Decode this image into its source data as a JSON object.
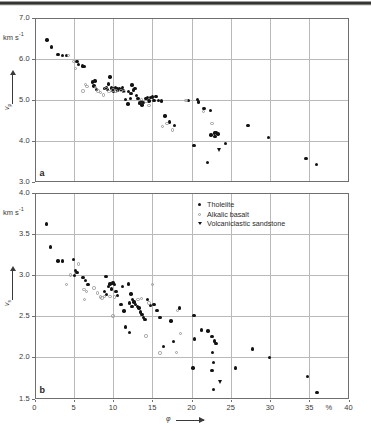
{
  "figure": {
    "panel_a_label": "a",
    "panel_b_label": "b",
    "xaxis_symbol": "φ",
    "percent_symbol": "%",
    "unit_label": "km s",
    "unit_exponent": "-1",
    "vp_symbol": "v",
    "vp_sub": "p",
    "vs_symbol": "v",
    "vs_sub": "s"
  },
  "legend": {
    "items": [
      {
        "label": "Tholeiite",
        "marker": "filled-circle",
        "color": "#121212"
      },
      {
        "label": "Alkalic basalt",
        "marker": "open-circle",
        "color": "#9a9a98"
      },
      {
        "label": "Volcaniclastic sandstone",
        "marker": "filled-triangle-down",
        "color": "#121212"
      }
    ]
  },
  "chart_data": [
    {
      "type": "scatter",
      "panel": "a",
      "title": "",
      "xlabel": "φ",
      "ylabel": "v_p",
      "yunit": "km s^-1",
      "xunit": "%",
      "xlim": [
        0,
        40
      ],
      "ylim": [
        3.0,
        7.0
      ],
      "xticks": [
        0,
        5,
        10,
        15,
        20,
        25,
        30,
        35,
        40
      ],
      "yticks": [
        3.0,
        4.0,
        5.0,
        6.0,
        7.0
      ],
      "ytick_labels": [
        "3.0",
        "4.0",
        "5.0",
        "6.0",
        "7.0"
      ],
      "xtick_labels": [
        "0",
        "5",
        "10",
        "15",
        "20",
        "25",
        "30",
        "35",
        "40"
      ],
      "grid": true,
      "legend_position": "none",
      "series": [
        {
          "name": "Tholeiite",
          "marker": "filled-circle",
          "points": [
            [
              1.6,
              6.45
            ],
            [
              2.2,
              6.28
            ],
            [
              3.0,
              6.1
            ],
            [
              3.6,
              6.07
            ],
            [
              4.1,
              6.08
            ],
            [
              5.4,
              5.92
            ],
            [
              5.6,
              5.86
            ],
            [
              6.1,
              5.82
            ],
            [
              6.3,
              5.8
            ],
            [
              7.4,
              5.43
            ],
            [
              7.7,
              5.45
            ],
            [
              7.6,
              5.33
            ],
            [
              7.9,
              5.25
            ],
            [
              9.2,
              5.3
            ],
            [
              9.4,
              5.38
            ],
            [
              9.6,
              5.55
            ],
            [
              9.8,
              5.28
            ],
            [
              9.9,
              5.22
            ],
            [
              10.1,
              5.27
            ],
            [
              10.3,
              5.29
            ],
            [
              10.5,
              5.26
            ],
            [
              10.1,
              5.21
            ],
            [
              10.6,
              5.22
            ],
            [
              10.8,
              5.27
            ],
            [
              11.0,
              5.25
            ],
            [
              11.2,
              5.3
            ],
            [
              11.3,
              5.21
            ],
            [
              9.0,
              5.27
            ],
            [
              9.3,
              5.24
            ],
            [
              11.6,
              5.0
            ],
            [
              11.9,
              4.89
            ],
            [
              12.2,
              5.02
            ],
            [
              12.4,
              5.35
            ],
            [
              12.6,
              5.23
            ],
            [
              12.8,
              5.27
            ],
            [
              13.0,
              5.1
            ],
            [
              13.2,
              5.02
            ],
            [
              12.0,
              5.2
            ],
            [
              12.3,
              5.15
            ],
            [
              13.6,
              4.95
            ],
            [
              13.9,
              4.93
            ],
            [
              14.2,
              5.02
            ],
            [
              14.4,
              5.05
            ],
            [
              14.6,
              4.96
            ],
            [
              14.8,
              5.05
            ],
            [
              15.0,
              5.06
            ],
            [
              15.2,
              4.97
            ],
            [
              15.5,
              5.07
            ],
            [
              15.8,
              4.97
            ],
            [
              16.2,
              4.96
            ],
            [
              13.4,
              4.91
            ],
            [
              13.7,
              4.87
            ],
            [
              16.6,
              4.6
            ],
            [
              17.2,
              4.45
            ],
            [
              17.8,
              4.36
            ],
            [
              19.6,
              4.97
            ],
            [
              20.8,
              5.0
            ],
            [
              20.9,
              4.94
            ],
            [
              21.6,
              4.78
            ],
            [
              22.4,
              4.73
            ],
            [
              22.5,
              4.13
            ],
            [
              22.9,
              4.18
            ],
            [
              23.1,
              4.19
            ],
            [
              23.4,
              4.16
            ],
            [
              23.0,
              4.1
            ],
            [
              20.3,
              3.88
            ],
            [
              22.0,
              3.46
            ],
            [
              24.3,
              3.92
            ],
            [
              27.2,
              4.36
            ],
            [
              29.8,
              4.07
            ],
            [
              34.6,
              3.56
            ],
            [
              35.9,
              3.41
            ]
          ]
        },
        {
          "name": "Alkalic basalt",
          "marker": "open-circle",
          "points": [
            [
              4.3,
              6.08
            ],
            [
              5.0,
              5.92
            ],
            [
              5.2,
              5.76
            ],
            [
              6.5,
              5.36
            ],
            [
              6.7,
              5.32
            ],
            [
              6.2,
              5.21
            ],
            [
              7.8,
              5.3
            ],
            [
              8.1,
              5.21
            ],
            [
              8.4,
              5.17
            ],
            [
              8.8,
              5.11
            ],
            [
              9.1,
              5.27
            ],
            [
              9.5,
              5.2
            ],
            [
              10.0,
              5.23
            ],
            [
              10.4,
              5.21
            ],
            [
              11.0,
              5.22
            ],
            [
              11.4,
              5.2
            ],
            [
              13.6,
              5.0
            ],
            [
              14.2,
              4.95
            ],
            [
              14.6,
              4.86
            ],
            [
              16.3,
              4.34
            ],
            [
              16.9,
              4.41
            ],
            [
              17.6,
              4.26
            ],
            [
              19.3,
              4.97
            ],
            [
              21.5,
              4.7
            ],
            [
              22.6,
              4.41
            ]
          ]
        },
        {
          "name": "Volcaniclastic sandstone",
          "marker": "filled-triangle-down",
          "points": [
            [
              23.6,
              3.76
            ]
          ]
        }
      ]
    },
    {
      "type": "scatter",
      "panel": "b",
      "title": "",
      "xlabel": "φ",
      "ylabel": "v_s",
      "yunit": "km s^-1",
      "xunit": "%",
      "xlim": [
        0,
        40
      ],
      "ylim": [
        1.5,
        4.0
      ],
      "xticks": [
        0,
        5,
        10,
        15,
        20,
        25,
        30,
        35,
        40
      ],
      "yticks": [
        1.5,
        2.0,
        2.5,
        3.0,
        3.5,
        4.0
      ],
      "ytick_labels": [
        "1.5",
        "2.0",
        "2.5",
        "3.0",
        "3.5",
        "4.0"
      ],
      "xtick_labels": [
        "0",
        "5",
        "10",
        "15",
        "20",
        "25",
        "30",
        "35",
        "40"
      ],
      "grid": true,
      "legend_position": "top-center",
      "series": [
        {
          "name": "Tholeiite",
          "marker": "filled-circle",
          "points": [
            [
              1.5,
              3.62
            ],
            [
              2.0,
              3.34
            ],
            [
              3.0,
              3.17
            ],
            [
              3.6,
              3.17
            ],
            [
              5.0,
              3.19
            ],
            [
              5.2,
              3.05
            ],
            [
              5.4,
              3.03
            ],
            [
              5.1,
              2.99
            ],
            [
              6.2,
              2.97
            ],
            [
              6.5,
              2.93
            ],
            [
              6.8,
              2.88
            ],
            [
              9.1,
              2.98
            ],
            [
              9.4,
              2.86
            ],
            [
              9.6,
              2.89
            ],
            [
              9.8,
              2.83
            ],
            [
              10.0,
              2.9
            ],
            [
              10.2,
              2.88
            ],
            [
              10.4,
              2.8
            ],
            [
              10.6,
              2.75
            ],
            [
              8.9,
              2.8
            ],
            [
              9.2,
              2.76
            ],
            [
              11.0,
              2.64
            ],
            [
              11.4,
              2.56
            ],
            [
              11.2,
              2.86
            ],
            [
              12.0,
              2.89
            ],
            [
              12.3,
              2.77
            ],
            [
              12.5,
              2.7
            ],
            [
              12.7,
              2.67
            ],
            [
              12.9,
              2.64
            ],
            [
              13.1,
              2.62
            ],
            [
              13.3,
              2.6
            ],
            [
              13.5,
              2.55
            ],
            [
              13.7,
              2.52
            ],
            [
              13.9,
              2.48
            ],
            [
              14.1,
              2.46
            ],
            [
              12.1,
              2.66
            ],
            [
              12.4,
              2.62
            ],
            [
              14.4,
              2.7
            ],
            [
              14.8,
              2.63
            ],
            [
              15.2,
              2.64
            ],
            [
              15.6,
              2.57
            ],
            [
              16.0,
              2.48
            ],
            [
              11.6,
              2.37
            ],
            [
              12.1,
              2.3
            ],
            [
              16.4,
              2.13
            ],
            [
              17.4,
              2.44
            ],
            [
              17.7,
              2.19
            ],
            [
              18.5,
              2.6
            ],
            [
              20.3,
              2.51
            ],
            [
              20.4,
              2.22
            ],
            [
              21.3,
              2.33
            ],
            [
              22.1,
              2.32
            ],
            [
              22.6,
              2.25
            ],
            [
              22.9,
              2.2
            ],
            [
              23.1,
              2.17
            ],
            [
              22.7,
              2.06
            ],
            [
              22.8,
              1.94
            ],
            [
              22.6,
              1.84
            ],
            [
              20.2,
              1.87
            ],
            [
              22.8,
              1.61
            ],
            [
              25.6,
              1.87
            ],
            [
              27.8,
              2.1
            ],
            [
              29.9,
              2.0
            ],
            [
              34.8,
              1.77
            ],
            [
              36.0,
              1.57
            ]
          ]
        },
        {
          "name": "Alkalic basalt",
          "marker": "open-circle",
          "points": [
            [
              4.1,
              2.88
            ],
            [
              4.6,
              3.0
            ],
            [
              5.6,
              3.13
            ],
            [
              6.3,
              2.82
            ],
            [
              6.6,
              2.8
            ],
            [
              6.4,
              2.7
            ],
            [
              7.6,
              2.84
            ],
            [
              8.0,
              2.78
            ],
            [
              8.4,
              2.73
            ],
            [
              8.6,
              2.72
            ],
            [
              8.9,
              2.74
            ],
            [
              9.6,
              2.74
            ],
            [
              10.2,
              2.73
            ],
            [
              10.0,
              2.5
            ],
            [
              13.2,
              2.7
            ],
            [
              13.6,
              2.71
            ],
            [
              14.6,
              2.66
            ],
            [
              15.0,
              2.88
            ],
            [
              14.2,
              2.26
            ],
            [
              16.0,
              2.05
            ],
            [
              18.2,
              2.57
            ],
            [
              18.6,
              2.29
            ],
            [
              18.1,
              2.06
            ]
          ]
        },
        {
          "name": "Volcaniclastic sandstone",
          "marker": "filled-triangle-down",
          "points": [
            [
              23.7,
              1.7
            ]
          ]
        }
      ]
    }
  ]
}
